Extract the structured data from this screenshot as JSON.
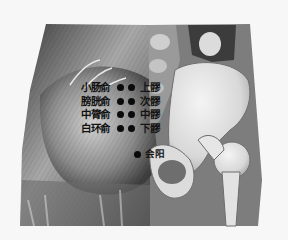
{
  "figure": {
    "colors": {
      "background": "#f7f7f7",
      "muscle_dark": "#4a4a4a",
      "muscle_light": "#c9c9c9",
      "bone": "#e6e6e6",
      "shadow_gray": "#7a7a7a",
      "dot": "#0a0a0a"
    }
  },
  "points": {
    "left": [
      {
        "label": "小肠俞"
      },
      {
        "label": "膀胱俞"
      },
      {
        "label": "中膂俞"
      },
      {
        "label": "白环俞"
      }
    ],
    "right": [
      {
        "label": "上髎"
      },
      {
        "label": "次髎"
      },
      {
        "label": "中髎"
      },
      {
        "label": "下髎"
      }
    ],
    "bottom": {
      "label": "会阳"
    }
  }
}
